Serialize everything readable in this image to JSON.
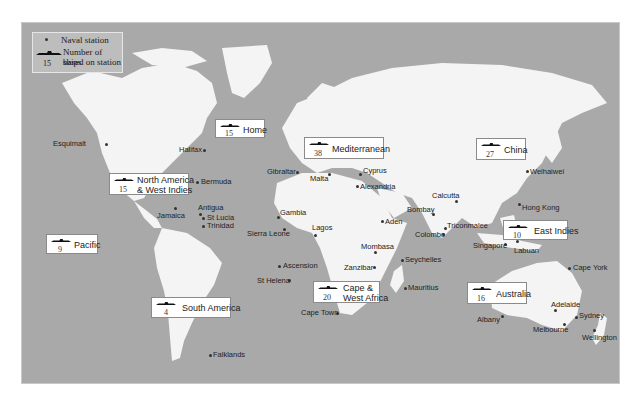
{
  "legend": {
    "station_label": "Naval station",
    "ships_label_line1": "Number of ships",
    "ships_label_line2": "based on station",
    "example_count": "15",
    "icons": [
      "station-dot-icon",
      "warship-icon"
    ]
  },
  "fleets": [
    {
      "id": "home",
      "name": "Home",
      "count": "15"
    },
    {
      "id": "mediterranean",
      "name": "Mediterranean",
      "count": "38"
    },
    {
      "id": "china",
      "name": "China",
      "count": "27"
    },
    {
      "id": "north-america",
      "name_line1": "North America",
      "name_line2": "& West Indies",
      "count": "15"
    },
    {
      "id": "pacific",
      "name": "Pacific",
      "count": "9"
    },
    {
      "id": "east-indies",
      "name": "East Indies",
      "count": "10"
    },
    {
      "id": "cape",
      "name_line1": "Cape &",
      "name_line2": "West Africa",
      "count": "20"
    },
    {
      "id": "australia",
      "name": "Australia",
      "count": "16"
    },
    {
      "id": "south-america",
      "name": "South America",
      "count": "4"
    }
  ],
  "stations": [
    "Esquimalt",
    "Halifax",
    "Bermuda",
    "Jamaica",
    "Antigua",
    "St Lucia",
    "Trinidad",
    "Gibraltar",
    "Malta",
    "Cyprus",
    "Alexandria",
    "Gambia",
    "Sierra Leone",
    "Lagos",
    "Ascension",
    "St Helena",
    "Cape Town",
    "Zanzibar",
    "Mombasa",
    "Seychelles",
    "Mauritius",
    "Aden",
    "Bombay",
    "Calcutta",
    "Colombo",
    "Triconmalee",
    "Singapore",
    "Labuan",
    "Hong Kong",
    "Weihaiwei",
    "Cape York",
    "Adelaide",
    "Sydney",
    "Melbourne",
    "Albany",
    "Wellington",
    "Falklands"
  ],
  "colors": {
    "sea": "#a9a9a9",
    "land": "#f4f4f4",
    "legend_bg": "#bdbdbd",
    "label_box": "#ffffff"
  }
}
